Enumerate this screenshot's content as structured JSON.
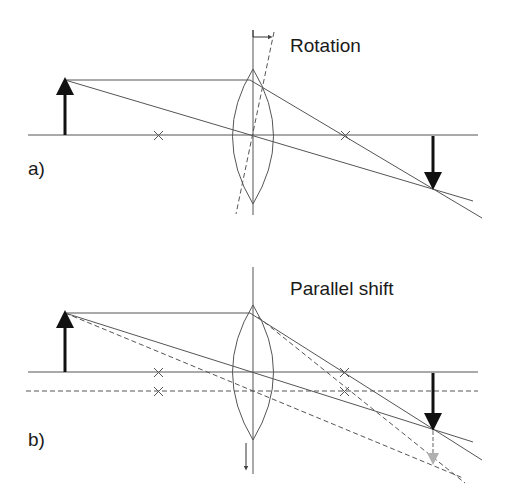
{
  "diagram": {
    "panel_a": {
      "label": "a)",
      "title": "Rotation"
    },
    "panel_b": {
      "label": "b)",
      "title": "Parallel shift"
    },
    "colors": {
      "line": "#555555",
      "arrow": "#111111",
      "shifted_arrow": "#b0b0b0",
      "background": "#ffffff"
    }
  }
}
